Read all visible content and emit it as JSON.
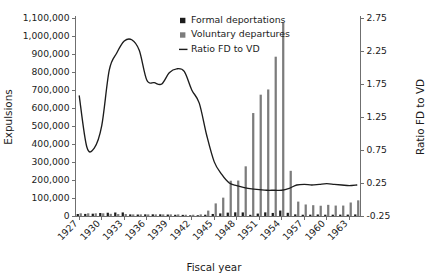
{
  "chart_data": {
    "type": "bar",
    "title": "",
    "xlabel": "Fiscal year",
    "ylabel": "Expulsions",
    "y2label": "Ratio FD to VD",
    "grid": false,
    "legend_position": "top-right",
    "ylim": [
      0,
      1100000
    ],
    "y2lim": [
      -0.25,
      2.75
    ],
    "ytick_values": [
      0,
      100000,
      200000,
      300000,
      400000,
      500000,
      600000,
      700000,
      800000,
      900000,
      1000000,
      1100000
    ],
    "ytick_labels": [
      "0",
      "100,000",
      "200,000",
      "300,000",
      "400,000",
      "500,000",
      "600,000",
      "700,000",
      "800,000",
      "900,000",
      "1,000,000",
      "1,100,000"
    ],
    "y2tick_values": [
      -0.25,
      0.25,
      0.75,
      1.25,
      1.75,
      2.25,
      2.75
    ],
    "y2tick_labels": [
      "-0.25",
      "0.25",
      "0.75",
      "1.25",
      "1.75",
      "2.25",
      "2.75"
    ],
    "categories": [
      1927,
      1928,
      1929,
      1930,
      1931,
      1932,
      1933,
      1934,
      1935,
      1936,
      1937,
      1938,
      1939,
      1940,
      1941,
      1942,
      1943,
      1944,
      1945,
      1946,
      1947,
      1948,
      1949,
      1950,
      1951,
      1952,
      1953,
      1954,
      1955,
      1956,
      1957,
      1958,
      1959,
      1960,
      1961,
      1962,
      1963,
      1964
    ],
    "xtick_labels": [
      "1927",
      "1930",
      "1933",
      "1936",
      "1939",
      "1942",
      "1945",
      "1948",
      "1951",
      "1954",
      "1957",
      "1960",
      "1963"
    ],
    "xtick_years": [
      1927,
      1930,
      1933,
      1936,
      1939,
      1942,
      1945,
      1948,
      1951,
      1954,
      1957,
      1960,
      1963
    ],
    "legend": [
      {
        "label": "Formal deportations",
        "marker": "square",
        "color": "#1c1c1c"
      },
      {
        "label": "Voluntary departures",
        "marker": "square",
        "color": "#7c7c7c"
      },
      {
        "label": "Ratio FD to VD",
        "marker": "line",
        "color": "#1c1c1c"
      }
    ],
    "series": [
      {
        "name": "Formal deportations",
        "axis": "left",
        "color": "#1c1c1c",
        "values": [
          11000,
          11600,
          12900,
          16600,
          18100,
          19400,
          19900,
          8900,
          8300,
          9200,
          9300,
          9300,
          8200,
          6900,
          6400,
          4000,
          4200,
          7200,
          11300,
          14400,
          18700,
          20400,
          20000,
          6600,
          13500,
          20200,
          17000,
          30300,
          17700,
          9000,
          7100,
          7500,
          8500,
          7200,
          7400,
          7600,
          7800,
          8700
        ]
      },
      {
        "name": "Voluntary departures",
        "axis": "left",
        "color": "#7c7c7c",
        "values": [
          15000,
          15000,
          15000,
          15000,
          12000,
          11000,
          11000,
          9000,
          9000,
          9000,
          9000,
          9000,
          9000,
          9000,
          7000,
          7000,
          9000,
          30000,
          70000,
          102000,
          196000,
          197000,
          276000,
          572000,
          674000,
          703000,
          885000,
          1075000,
          251000,
          80000,
          64000,
          60000,
          57000,
          62000,
          58000,
          58000,
          75000,
          87000
        ]
      }
    ],
    "ratio_series": {
      "name": "Ratio FD to VD",
      "axis": "right",
      "color": "#1c1c1c",
      "values": [
        1.57,
        0.8,
        0.78,
        1.12,
        1.96,
        2.22,
        2.4,
        2.42,
        2.26,
        1.81,
        1.77,
        1.75,
        1.92,
        1.98,
        1.94,
        1.66,
        1.46,
        0.97,
        0.57,
        0.38,
        0.25,
        0.21,
        0.18,
        0.16,
        0.15,
        0.14,
        0.14,
        0.14,
        0.17,
        0.22,
        0.23,
        0.22,
        0.23,
        0.24,
        0.23,
        0.22,
        0.21,
        0.22
      ]
    }
  }
}
